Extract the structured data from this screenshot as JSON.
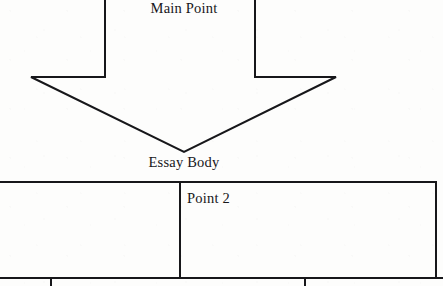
{
  "document": {
    "kind": "essay-planning-graphic-organizer",
    "background_color": "#fdfdfc",
    "ink_color": "#17171a"
  },
  "labels": {
    "main_point": "Main Point",
    "essay_body": "Essay Body",
    "point_2": "Point 2"
  },
  "diagram": {
    "arrow": {
      "name": "down-arrow",
      "direction": "down",
      "shaft_left_x": 105,
      "shaft_right_x": 255,
      "shaft_top_y": -1,
      "shoulder_y": 77,
      "barb_left_x": 31,
      "barb_right_x": 336,
      "tip_x": 184,
      "tip_y": 152,
      "stroke_width": 2,
      "fill": "none",
      "stroke": "#17171a"
    },
    "body_row": {
      "name": "essay-body-boxes",
      "top_y": 182,
      "bottom_y": 278,
      "left_x": -2,
      "right_x": 436,
      "divider_x": [
        180
      ],
      "cells": [
        {
          "label": "",
          "x": -2,
          "width": 182
        },
        {
          "label": "Point 2",
          "x": 180,
          "width": 256
        }
      ]
    },
    "sub_row": {
      "name": "supporting-detail-boxes",
      "top_y": 278,
      "bottom_y": 292,
      "left_x": -2,
      "right_x": 443,
      "divider_x": [
        51,
        305
      ],
      "cells": [
        {
          "label": "",
          "x": -2,
          "width": 53
        },
        {
          "label": "",
          "x": 51,
          "width": 254
        },
        {
          "label": "",
          "x": 305,
          "width": 138
        }
      ]
    }
  }
}
